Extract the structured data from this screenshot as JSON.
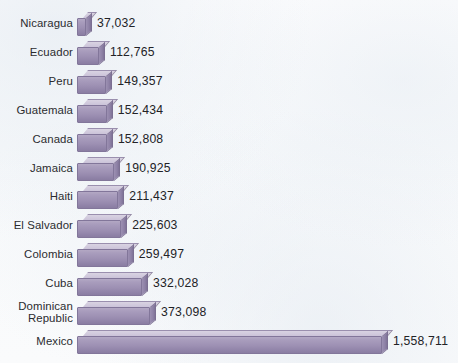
{
  "chart_data": {
    "type": "bar",
    "orientation": "horizontal",
    "title": "",
    "subtitle": "",
    "xlabel": "",
    "ylabel": "",
    "grid": false,
    "legend": null,
    "axis_visible": false,
    "value_labels": true,
    "xlim": [
      0,
      1558711
    ],
    "categories": [
      "Nicaragua",
      "Ecuador",
      "Peru",
      "Guatemala",
      "Canada",
      "Jamaica",
      "Haiti",
      "El Salvador",
      "Colombia",
      "Cuba",
      "Dominican\nRepublic",
      "Mexico"
    ],
    "values": [
      37032,
      112765,
      149357,
      152434,
      152808,
      190925,
      211437,
      225603,
      259497,
      332028,
      373098,
      1558711
    ],
    "value_label_text": [
      "37,032",
      "112,765",
      "149,357",
      "152,434",
      "152,808",
      "190,925",
      "211,437",
      "225,603",
      "259,497",
      "332,028",
      "373,098",
      "1,558,711"
    ],
    "colors": {
      "bar_front": "#9d90b3",
      "bar_top": "#cbc3d9",
      "bar_side": "#8e81a6",
      "bar_outline": "#82769a",
      "background": "#fbfcfd",
      "label_text": "#2b2b2f",
      "value_text": "#222226"
    }
  }
}
